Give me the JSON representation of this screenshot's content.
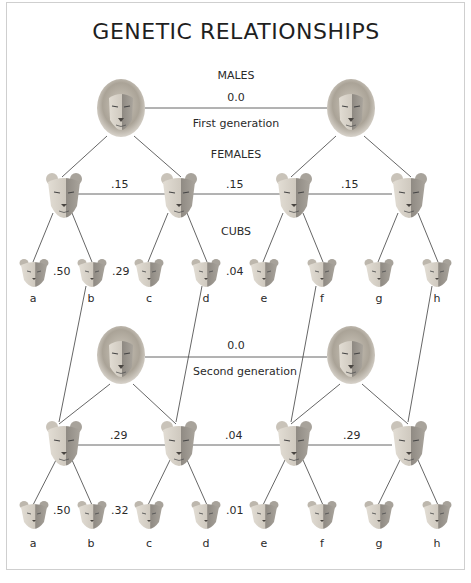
{
  "title": "GENETIC RELATIONSHIPS",
  "labels": {
    "males": "MALES",
    "females": "FEMALES",
    "cubs": "CUBS",
    "first_generation": "First generation",
    "second_generation": "Second generation"
  },
  "first_generation": {
    "males_relatedness": "0.0",
    "female_relatedness": [
      ".15",
      ".15",
      ".15"
    ],
    "cub_relatedness": [
      ".50",
      ".29",
      ".04"
    ],
    "cub_labels": [
      "a",
      "b",
      "c",
      "d",
      "e",
      "f",
      "g",
      "h"
    ]
  },
  "second_generation": {
    "males_relatedness": "0.0",
    "female_relatedness": [
      ".29",
      ".04",
      ".29"
    ],
    "cub_relatedness": [
      ".50",
      ".32",
      ".01"
    ],
    "cub_labels": [
      "a",
      "b",
      "c",
      "d",
      "e",
      "f",
      "g",
      "h"
    ]
  },
  "icons": {
    "male": "male-lion-head-icon",
    "female": "lioness-head-icon",
    "cub": "lion-cub-head-icon"
  },
  "colors": {
    "line": "#555555",
    "frame": "#cfcfcf",
    "mane": "#b9b3a8",
    "face": "#d6d0c6",
    "shade": "#8c8780"
  }
}
